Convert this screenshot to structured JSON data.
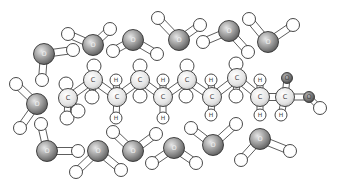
{
  "diagram": {
    "title": "",
    "atom_labels": {
      "oxygen": "O",
      "carbon": "C",
      "hydrogen": "H"
    },
    "colors": {
      "oxygen_fill_light": "#d8d8d8",
      "oxygen_fill_dark": "#6a6a6a",
      "carbon_fill_light": "#ffffff",
      "carbon_fill_dark": "#cfcfcf",
      "hydrogen_fill": "#ffffff",
      "outline": "#333333",
      "bond_fill": "#ffffff"
    },
    "water_molecules": [
      {
        "id": "w1"
      },
      {
        "id": "w2"
      },
      {
        "id": "w3"
      },
      {
        "id": "w4"
      },
      {
        "id": "w5"
      },
      {
        "id": "w6"
      },
      {
        "id": "w7"
      },
      {
        "id": "w8"
      },
      {
        "id": "w9"
      },
      {
        "id": "w10"
      },
      {
        "id": "w11"
      },
      {
        "id": "w12"
      },
      {
        "id": "w13"
      }
    ],
    "chain": {
      "carbons": 10,
      "labeled_hydrogens": "H",
      "terminal_group": "carboxyl"
    }
  }
}
